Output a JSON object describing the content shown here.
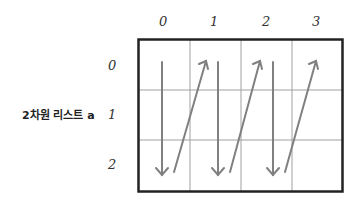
{
  "title": "2차원 리스트 a",
  "col_labels": [
    "0",
    "1",
    "2",
    "3"
  ],
  "row_labels": [
    "0",
    "1",
    "2"
  ],
  "colors": {
    "border": "#222222",
    "grid": "#a0a0a0",
    "arrow": "#808080"
  }
}
